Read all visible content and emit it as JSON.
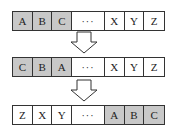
{
  "diagram": {
    "highlight_color": "#c8c8c8",
    "rows": [
      {
        "cells": [
          {
            "label": "A",
            "highlight": true
          },
          {
            "label": "B",
            "highlight": true
          },
          {
            "label": "C",
            "highlight": true
          },
          {
            "label": "···",
            "highlight": false
          },
          {
            "label": "X",
            "highlight": false
          },
          {
            "label": "Y",
            "highlight": false
          },
          {
            "label": "Z",
            "highlight": false
          }
        ]
      },
      {
        "cells": [
          {
            "label": "C",
            "highlight": true
          },
          {
            "label": "B",
            "highlight": true
          },
          {
            "label": "A",
            "highlight": true
          },
          {
            "label": "···",
            "highlight": false
          },
          {
            "label": "X",
            "highlight": false
          },
          {
            "label": "Y",
            "highlight": false
          },
          {
            "label": "Z",
            "highlight": false
          }
        ]
      },
      {
        "cells": [
          {
            "label": "Z",
            "highlight": false
          },
          {
            "label": "X",
            "highlight": false
          },
          {
            "label": "Y",
            "highlight": false
          },
          {
            "label": "···",
            "highlight": false
          },
          {
            "label": "A",
            "highlight": true
          },
          {
            "label": "B",
            "highlight": true
          },
          {
            "label": "C",
            "highlight": true
          }
        ]
      }
    ],
    "arrows": [
      {
        "icon": "down-arrow-icon"
      },
      {
        "icon": "down-arrow-icon"
      }
    ]
  }
}
